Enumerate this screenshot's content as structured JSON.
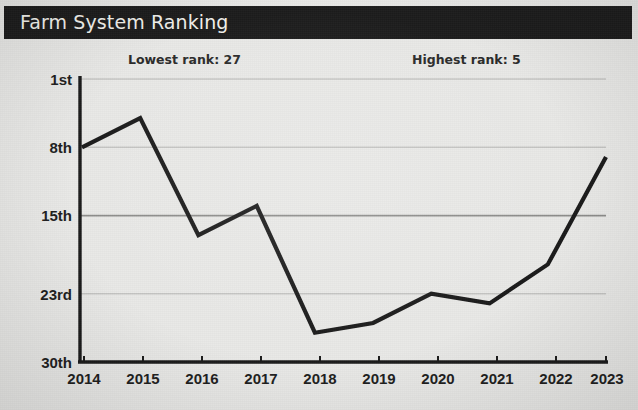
{
  "header": {
    "title": "Farm System Ranking",
    "bar_color": "#1c1c1c",
    "text_color": "#f2f1ec"
  },
  "annotations": {
    "lowest": "Lowest rank: 27",
    "highest": "Highest rank: 5"
  },
  "axis": {
    "y_ticks": [
      "1st",
      "8th",
      "15th",
      "23rd",
      "30th"
    ],
    "x_ticks": [
      "2014",
      "2015",
      "2016",
      "2017",
      "2018",
      "2019",
      "2020",
      "2021",
      "2022",
      "2023"
    ]
  },
  "style": {
    "line_color": "#1a1a1a",
    "grid_color": "#bdbdbd",
    "axis_color": "#1a1a1a",
    "background": "#e9e9e7"
  },
  "chart_data": {
    "type": "line",
    "title": "Farm System Ranking",
    "xlabel": "",
    "ylabel": "",
    "x": [
      2014,
      2015,
      2016,
      2017,
      2018,
      2019,
      2020,
      2021,
      2022,
      2023
    ],
    "categories": [
      "2014",
      "2015",
      "2016",
      "2017",
      "2018",
      "2019",
      "2020",
      "2021",
      "2022",
      "2023"
    ],
    "values": [
      8,
      5,
      17,
      14,
      27,
      26,
      23,
      24,
      20,
      9
    ],
    "series": [
      {
        "name": "Farm System Ranking",
        "values": [
          8,
          5,
          17,
          14,
          27,
          26,
          23,
          24,
          20,
          9
        ]
      }
    ],
    "y_tick_values": [
      1,
      8,
      15,
      23,
      30
    ],
    "y_tick_labels": [
      "1st",
      "8th",
      "15th",
      "23rd",
      "30th"
    ],
    "ylim": [
      1,
      30
    ],
    "y_inverted": true,
    "grid": true,
    "legend": false,
    "annotations": [
      "Lowest rank: 27",
      "Highest rank: 5"
    ],
    "lowest_rank": 27,
    "highest_rank": 5
  }
}
